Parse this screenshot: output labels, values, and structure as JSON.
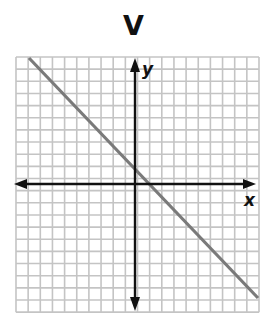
{
  "chart_data": {
    "type": "line",
    "title": "V",
    "xlabel": "x",
    "ylabel": "y",
    "grid": true,
    "xlim": [
      -10,
      10
    ],
    "ylim": [
      -10.5,
      10.5
    ],
    "series": [
      {
        "name": "line",
        "x": [
          -9,
          10
        ],
        "y": [
          10.4,
          -9.4
        ],
        "color": "#7a7a7a"
      }
    ]
  },
  "labels": {
    "title": "V",
    "x_axis": "x",
    "y_axis": "y"
  },
  "colors": {
    "grid": "#c4c4c4",
    "axis": "#111111",
    "line": "#7a7a7a"
  }
}
